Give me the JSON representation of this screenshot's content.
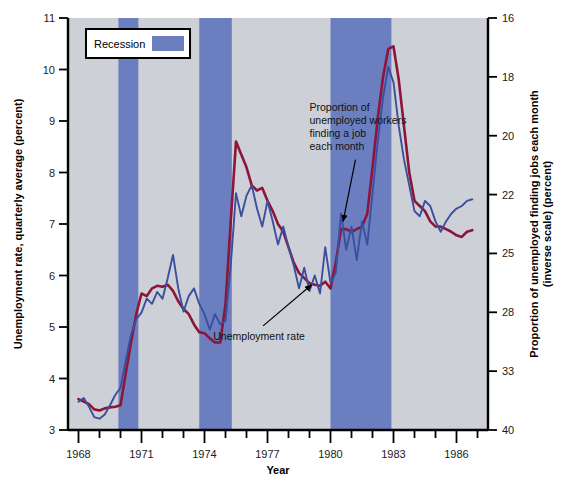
{
  "chart_data": {
    "type": "line",
    "title": "",
    "xlabel": "Year",
    "ylabel_left": "Unemployment rate, quarterly average (percent)",
    "ylabel_right_line1": "Proportion of unemployed finding jobs each month",
    "ylabel_right_line2": "(inverse scale) (percent)",
    "grid": false,
    "xlim": [
      1967.5,
      1987.5
    ],
    "ylim_left": [
      3,
      11
    ],
    "ylim_right_inverse": [
      16,
      40
    ],
    "x_tick_values": [
      1968,
      1969,
      1970,
      1971,
      1972,
      1973,
      1974,
      1975,
      1976,
      1977,
      1978,
      1979,
      1980,
      1981,
      1982,
      1983,
      1984,
      1985,
      1986,
      1987
    ],
    "x_tick_labels": [
      "1968",
      "",
      "",
      "1971",
      "",
      "",
      "1974",
      "",
      "",
      "1977",
      "",
      "",
      "1980",
      "",
      "",
      "1983",
      "",
      "",
      "1986",
      ""
    ],
    "y_left_ticks": [
      3,
      4,
      5,
      6,
      7,
      8,
      9,
      10,
      11
    ],
    "y_right_ticks": [
      16,
      18,
      20,
      22,
      25,
      28,
      33,
      40
    ],
    "legend": {
      "position": "top-left-inside",
      "entries": [
        {
          "label": "Recession",
          "color": "#6b7fc0",
          "type": "band"
        }
      ]
    },
    "annotations": [
      {
        "name": "job-finding-annotation",
        "text_lines": [
          "Proportion of",
          "unemployed workers",
          "finding a job",
          "each month"
        ],
        "text_x": 1979.0,
        "text_y_left": 9.2,
        "arrow_to_x": 1980.6,
        "arrow_to_y_left": 7.05
      },
      {
        "name": "unemployment-rate-annotation",
        "text_lines": [
          "Unemployment rate"
        ],
        "text_x": 1976.6,
        "text_y_left": 4.75,
        "arrow_to_x": 1979.1,
        "arrow_to_y_left": 5.82
      }
    ],
    "recession_bands": [
      {
        "start": 1969.9,
        "end": 1970.85,
        "label": "Recession 1969-70"
      },
      {
        "start": 1973.75,
        "end": 1975.3,
        "label": "Recession 1973-75"
      },
      {
        "start": 1980.0,
        "end": 1982.9,
        "label": "Recession 1980-82"
      }
    ],
    "plot_background": "#cdd0d6",
    "series": [
      {
        "name": "Unemployment rate",
        "color": "#8c1538",
        "axis": "left",
        "unit": "percent",
        "points": [
          [
            1968.0,
            3.6
          ],
          [
            1968.25,
            3.55
          ],
          [
            1968.5,
            3.5
          ],
          [
            1968.75,
            3.4
          ],
          [
            1969.0,
            3.38
          ],
          [
            1969.25,
            3.42
          ],
          [
            1969.5,
            3.44
          ],
          [
            1969.75,
            3.45
          ],
          [
            1970.0,
            3.48
          ],
          [
            1970.25,
            4.1
          ],
          [
            1970.5,
            4.7
          ],
          [
            1970.75,
            5.25
          ],
          [
            1971.0,
            5.65
          ],
          [
            1971.25,
            5.6
          ],
          [
            1971.5,
            5.75
          ],
          [
            1971.75,
            5.8
          ],
          [
            1972.0,
            5.78
          ],
          [
            1972.25,
            5.82
          ],
          [
            1972.5,
            5.7
          ],
          [
            1972.75,
            5.5
          ],
          [
            1973.0,
            5.35
          ],
          [
            1973.25,
            5.25
          ],
          [
            1973.5,
            5.05
          ],
          [
            1973.75,
            4.9
          ],
          [
            1974.0,
            4.88
          ],
          [
            1974.25,
            4.78
          ],
          [
            1974.5,
            4.7
          ],
          [
            1974.75,
            4.7
          ],
          [
            1975.0,
            5.45
          ],
          [
            1975.25,
            7.05
          ],
          [
            1975.5,
            8.6
          ],
          [
            1975.75,
            8.35
          ],
          [
            1976.0,
            8.1
          ],
          [
            1976.25,
            7.75
          ],
          [
            1976.5,
            7.65
          ],
          [
            1976.75,
            7.7
          ],
          [
            1977.0,
            7.45
          ],
          [
            1977.25,
            7.25
          ],
          [
            1977.5,
            7.0
          ],
          [
            1977.75,
            6.85
          ],
          [
            1978.0,
            6.55
          ],
          [
            1978.25,
            6.25
          ],
          [
            1978.5,
            6.05
          ],
          [
            1978.75,
            5.95
          ],
          [
            1979.0,
            5.85
          ],
          [
            1979.25,
            5.82
          ],
          [
            1979.5,
            5.8
          ],
          [
            1979.75,
            5.88
          ],
          [
            1980.0,
            5.75
          ],
          [
            1980.25,
            6.25
          ],
          [
            1980.5,
            6.9
          ],
          [
            1980.75,
            6.9
          ],
          [
            1981.0,
            6.85
          ],
          [
            1981.25,
            6.9
          ],
          [
            1981.5,
            6.95
          ],
          [
            1981.75,
            7.2
          ],
          [
            1982.0,
            8.1
          ],
          [
            1982.25,
            9.05
          ],
          [
            1982.5,
            9.85
          ],
          [
            1982.75,
            10.4
          ],
          [
            1983.0,
            10.45
          ],
          [
            1983.25,
            9.8
          ],
          [
            1983.5,
            8.9
          ],
          [
            1983.75,
            8.0
          ],
          [
            1984.0,
            7.45
          ],
          [
            1984.25,
            7.35
          ],
          [
            1984.5,
            7.25
          ],
          [
            1984.75,
            7.05
          ],
          [
            1985.0,
            6.95
          ],
          [
            1985.25,
            6.95
          ],
          [
            1985.5,
            6.9
          ],
          [
            1985.75,
            6.85
          ],
          [
            1986.0,
            6.78
          ],
          [
            1986.25,
            6.75
          ],
          [
            1986.5,
            6.85
          ],
          [
            1986.75,
            6.88
          ]
        ]
      },
      {
        "name": "Proportion of unemployed workers finding a job each month",
        "color": "#3b4f9e",
        "axis": "right",
        "unit": "percent (inverse scale)",
        "points_left_equiv": [
          [
            1968.0,
            3.55
          ],
          [
            1968.25,
            3.62
          ],
          [
            1968.5,
            3.45
          ],
          [
            1968.75,
            3.25
          ],
          [
            1969.0,
            3.22
          ],
          [
            1969.25,
            3.3
          ],
          [
            1969.5,
            3.48
          ],
          [
            1969.75,
            3.68
          ],
          [
            1970.0,
            3.82
          ],
          [
            1970.25,
            4.35
          ],
          [
            1970.5,
            4.85
          ],
          [
            1970.75,
            5.15
          ],
          [
            1971.0,
            5.28
          ],
          [
            1971.25,
            5.55
          ],
          [
            1971.5,
            5.45
          ],
          [
            1971.75,
            5.68
          ],
          [
            1972.0,
            5.55
          ],
          [
            1972.25,
            5.95
          ],
          [
            1972.5,
            6.4
          ],
          [
            1972.75,
            5.75
          ],
          [
            1973.0,
            5.3
          ],
          [
            1973.25,
            5.6
          ],
          [
            1973.5,
            5.75
          ],
          [
            1973.75,
            5.45
          ],
          [
            1974.0,
            5.25
          ],
          [
            1974.25,
            4.95
          ],
          [
            1974.5,
            5.25
          ],
          [
            1974.75,
            5.05
          ],
          [
            1975.0,
            5.12
          ],
          [
            1975.25,
            6.2
          ],
          [
            1975.5,
            7.6
          ],
          [
            1975.75,
            7.15
          ],
          [
            1976.0,
            7.55
          ],
          [
            1976.25,
            7.75
          ],
          [
            1976.5,
            7.3
          ],
          [
            1976.75,
            6.95
          ],
          [
            1977.0,
            7.45
          ],
          [
            1977.25,
            7.05
          ],
          [
            1977.5,
            6.6
          ],
          [
            1977.75,
            6.95
          ],
          [
            1978.0,
            6.55
          ],
          [
            1978.25,
            6.2
          ],
          [
            1978.5,
            5.75
          ],
          [
            1978.75,
            6.15
          ],
          [
            1979.0,
            5.7
          ],
          [
            1979.25,
            6.0
          ],
          [
            1979.5,
            5.65
          ],
          [
            1979.75,
            6.55
          ],
          [
            1980.0,
            5.85
          ],
          [
            1980.25,
            6.05
          ],
          [
            1980.5,
            7.2
          ],
          [
            1980.75,
            6.5
          ],
          [
            1981.0,
            6.95
          ],
          [
            1981.25,
            6.3
          ],
          [
            1981.5,
            7.05
          ],
          [
            1981.75,
            6.6
          ],
          [
            1982.0,
            7.6
          ],
          [
            1982.25,
            8.6
          ],
          [
            1982.5,
            9.45
          ],
          [
            1982.75,
            10.05
          ],
          [
            1983.0,
            9.75
          ],
          [
            1983.25,
            8.9
          ],
          [
            1983.5,
            8.25
          ],
          [
            1983.75,
            7.75
          ],
          [
            1984.0,
            7.25
          ],
          [
            1984.25,
            7.15
          ],
          [
            1984.5,
            7.45
          ],
          [
            1984.75,
            7.35
          ],
          [
            1985.0,
            7.05
          ],
          [
            1985.25,
            6.85
          ],
          [
            1985.5,
            7.05
          ],
          [
            1985.75,
            7.2
          ],
          [
            1986.0,
            7.3
          ],
          [
            1986.25,
            7.35
          ],
          [
            1986.5,
            7.45
          ],
          [
            1986.75,
            7.48
          ]
        ]
      }
    ]
  },
  "legend": {
    "recession_label": "Recession"
  },
  "axes": {
    "x_title": "Year",
    "y_left_title": "Unemployment rate, quarterly average (percent)",
    "y_right_title_line1": "Proportion of unemployed finding jobs each month",
    "y_right_title_line2": "(inverse scale) (percent)"
  },
  "annotation_text": {
    "job_line1": "Proportion of",
    "job_line2": "unemployed workers",
    "job_line3": "finding a job",
    "job_line4": "each month",
    "unemployment": "Unemployment rate"
  },
  "tick_text": {
    "left": [
      "11",
      "10",
      "9",
      "8",
      "7",
      "6",
      "5",
      "4",
      "3"
    ],
    "right": [
      "16",
      "18",
      "20",
      "22",
      "25",
      "28",
      "33",
      "40"
    ],
    "x": [
      "1968",
      "1971",
      "1974",
      "1977",
      "1980",
      "1983",
      "1986"
    ]
  },
  "colors": {
    "unemployment_line": "#8c1538",
    "jobfinding_line": "#3b4f9e",
    "recession_band": "#6b7fc0",
    "plot_bg": "#cdd0d6",
    "axis": "#000000"
  }
}
